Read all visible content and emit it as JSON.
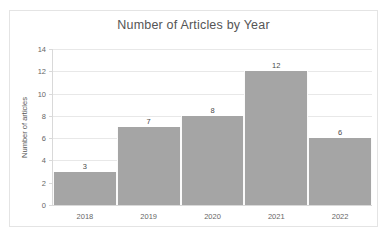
{
  "chart_data": {
    "type": "bar",
    "title": "Number of Articles by Year",
    "xlabel": "",
    "ylabel": "Number of articles",
    "categories": [
      "2018",
      "2019",
      "2020",
      "2021",
      "2022"
    ],
    "values": [
      3,
      7,
      8,
      12,
      6
    ],
    "value_labels": [
      "3",
      "7",
      "8",
      "12",
      "6"
    ],
    "ylim": [
      0,
      14
    ],
    "ytick_step": 2,
    "yticks": [
      0,
      2,
      4,
      6,
      8,
      10,
      12,
      14
    ],
    "ytick_labels": [
      "0",
      "2",
      "4",
      "6",
      "8",
      "10",
      "12",
      "14"
    ],
    "grid": "horizontal",
    "legend": "none",
    "bar_color": "#a5a5a5",
    "gridline_color": "#e8e8e8",
    "axis_color": "#d9d9d9",
    "title_color": "#555555",
    "label_color": "#666666",
    "plot_background": "#ffffff",
    "frame_border_color": "#e4e4e4",
    "bar_gap": "none"
  }
}
